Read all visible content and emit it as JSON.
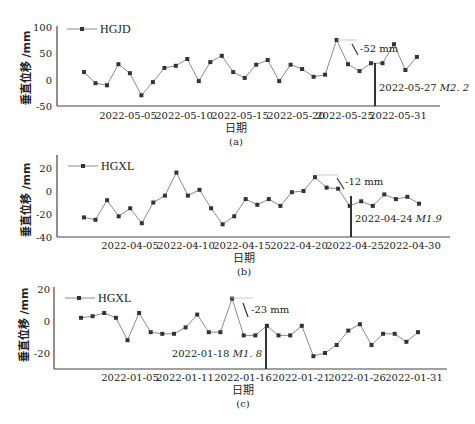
{
  "chart_data": [
    {
      "panel": "(a)",
      "type": "line",
      "series": [
        {
          "name": "HGJD",
          "values": [
            15,
            -6,
            -10,
            30,
            13,
            -29,
            -4,
            23,
            27,
            40,
            -2,
            34,
            46,
            15,
            4,
            29,
            38,
            -2,
            29,
            21,
            6,
            10,
            76,
            30,
            17,
            32,
            32,
            68,
            19,
            44
          ]
        }
      ],
      "x": [
        "2022-05-01",
        "2022-05-02",
        "2022-05-03",
        "2022-05-04",
        "2022-05-05",
        "2022-05-06",
        "2022-05-07",
        "2022-05-08",
        "2022-05-09",
        "2022-05-10",
        "2022-05-11",
        "2022-05-12",
        "2022-05-13",
        "2022-05-14",
        "2022-05-15",
        "2022-05-16",
        "2022-05-17",
        "2022-05-18",
        "2022-05-19",
        "2022-05-20",
        "2022-05-21",
        "2022-05-22",
        "2022-05-23",
        "2022-05-24",
        "2022-05-25",
        "2022-05-26",
        "2022-05-27",
        "2022-05-28",
        "2022-05-29",
        "2022-05-30"
      ],
      "xticks": [
        "2022-05-05",
        "2022-05-10",
        "2022-05-15",
        "2022-05-20",
        "2022-05-25",
        "2022-05-31"
      ],
      "yticks": [
        100,
        50,
        0,
        -50
      ],
      "ylim": [
        -50,
        100
      ],
      "xlabel": "日期",
      "ylabel": "垂直位移 /mm",
      "legend": "HGJD",
      "annotations": [
        {
          "text": "-52 mm",
          "type": "drop"
        },
        {
          "text_date": "2022-05-27",
          "text_mag": "M2. 2",
          "type": "earthquake-marker"
        }
      ],
      "caption": "(a)",
      "grid": false,
      "legend_position": "upper-left"
    },
    {
      "panel": "(b)",
      "type": "line",
      "series": [
        {
          "name": "HGXL",
          "values": [
            -23,
            -25,
            -8,
            -22,
            -15,
            -28,
            -10,
            -4,
            16,
            -4,
            1,
            -15,
            -29,
            -22,
            -7,
            -12,
            -7,
            -13,
            -1,
            0,
            12,
            3,
            2,
            -13,
            -9,
            -13,
            -3,
            -7,
            -5,
            -11
          ]
        }
      ],
      "x": [
        "2022-04-01",
        "2022-04-02",
        "2022-04-03",
        "2022-04-04",
        "2022-04-05",
        "2022-04-06",
        "2022-04-07",
        "2022-04-08",
        "2022-04-09",
        "2022-04-10",
        "2022-04-11",
        "2022-04-12",
        "2022-04-13",
        "2022-04-14",
        "2022-04-15",
        "2022-04-16",
        "2022-04-17",
        "2022-04-18",
        "2022-04-19",
        "2022-04-20",
        "2022-04-21",
        "2022-04-22",
        "2022-04-23",
        "2022-04-24",
        "2022-04-25",
        "2022-04-26",
        "2022-04-27",
        "2022-04-28",
        "2022-04-29",
        "2022-04-30"
      ],
      "xticks": [
        "2022-04-05",
        "2022-04-10",
        "2022-04-15",
        "2022-04-20",
        "2022-04-25",
        "2022-04-30"
      ],
      "yticks": [
        20,
        0,
        -20,
        -40
      ],
      "ylim": [
        -40,
        25
      ],
      "xlabel": "日期",
      "ylabel": "垂直位移 /mm",
      "legend": "HGXL",
      "annotations": [
        {
          "text": "-12 mm",
          "type": "drop"
        },
        {
          "text_date": "2022-04-24",
          "text_mag": "M1.9",
          "type": "earthquake-marker"
        }
      ],
      "caption": "(b)",
      "grid": false,
      "legend_position": "upper-left"
    },
    {
      "panel": "(c)",
      "type": "line",
      "series": [
        {
          "name": "HGXL",
          "values": [
            2,
            3,
            5,
            2,
            -12,
            5,
            -7,
            -8,
            -8,
            -4,
            4,
            -7,
            -7,
            14,
            -9,
            -9,
            -3,
            -9,
            -9,
            -3,
            -22,
            -20,
            -15,
            -6,
            -2,
            -15,
            -8,
            -8,
            -13,
            -7
          ]
        }
      ],
      "x": [
        "2022-01-01",
        "2022-01-02",
        "2022-01-03",
        "2022-01-04",
        "2022-01-05",
        "2022-01-06",
        "2022-01-07",
        "2022-01-08",
        "2022-01-09",
        "2022-01-10",
        "2022-01-11",
        "2022-01-12",
        "2022-01-13",
        "2022-01-14",
        "2022-01-15",
        "2022-01-16",
        "2022-01-17",
        "2022-01-18",
        "2022-01-19",
        "2022-01-20",
        "2022-01-21",
        "2022-01-22",
        "2022-01-23",
        "2022-01-24",
        "2022-01-25",
        "2022-01-26",
        "2022-01-27",
        "2022-01-28",
        "2022-01-29",
        "2022-01-30"
      ],
      "xticks": [
        "2022-01-05",
        "2022-01-11",
        "2022-01-16",
        "2022-01-21",
        "2022-01-26",
        "2022-01-31"
      ],
      "yticks": [
        20,
        0,
        -20
      ],
      "ylim": [
        -30,
        20
      ],
      "xlabel": "日期",
      "ylabel": "垂直位移 /mm",
      "legend": "HGXL",
      "annotations": [
        {
          "text": "-23 mm",
          "type": "drop"
        },
        {
          "text_date": "2022-01-18",
          "text_mag": "M1. 8",
          "type": "earthquake-marker"
        }
      ],
      "caption": "(c)",
      "grid": false,
      "legend_position": "upper-left"
    }
  ],
  "labels": {
    "a": {
      "legend": "HGJD",
      "ylabel": "垂直位移 /mm",
      "xlabel": "日期",
      "caption": "(a)",
      "drop": "-52 mm",
      "quake_date": "2022-05-27",
      "quake_mag": "M2. 2",
      "yticks": [
        "100",
        "50",
        "0",
        "-50"
      ],
      "xticks": [
        "2022-05-05",
        "2022-05-10",
        "2022-05-15",
        "2022-05-20",
        "2022-05-25",
        "2022-05-31"
      ]
    },
    "b": {
      "legend": "HGXL",
      "ylabel": "垂直位移 /mm",
      "xlabel": "日期",
      "caption": "(b)",
      "drop": "-12 mm",
      "quake_date": "2022-04-24",
      "quake_mag": "M1.9",
      "yticks": [
        "20",
        "0",
        "-20",
        "-40"
      ],
      "xticks": [
        "2022-04-05",
        "2022-04-10",
        "2022-04-15",
        "2022-04-20",
        "2022-04-25",
        "2022-04-30"
      ]
    },
    "c": {
      "legend": "HGXL",
      "ylabel": "垂直位移 /mm",
      "xlabel": "日期",
      "caption": "(c)",
      "drop": "-23 mm",
      "quake_date": "2022-01-18",
      "quake_mag": "M1. 8",
      "yticks": [
        "20",
        "0",
        "-20"
      ],
      "xticks": [
        "2022-01-05",
        "2022-01-11",
        "2022-01-16",
        "2022-01-21",
        "2022-01-26",
        "2022-01-31"
      ]
    }
  },
  "colors": {
    "line": "#8a8a8a",
    "marker": "#333333",
    "axis": "#444444",
    "text": "#222222"
  }
}
